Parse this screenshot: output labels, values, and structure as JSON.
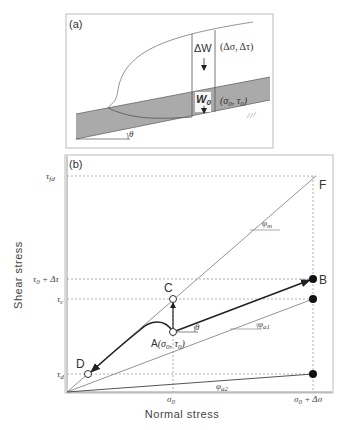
{
  "panel_a": {
    "label": "(a)",
    "delta_w": "ΔW",
    "delta_stress": "(Δσ, Δτ)",
    "w0": "W",
    "w0_sub": "0",
    "initial_stress": "(σ",
    "initial_stress_sub0": "0",
    "initial_stress_mid": ", τ",
    "initial_stress_sub1": "0",
    "initial_stress_end": ")",
    "angle": "θ"
  },
  "panel_b": {
    "label": "(b)",
    "x_axis_label": "Normal stress",
    "y_axis_label": "Shear stress",
    "y_ticks": {
      "tau_fd": "τ",
      "tau_fd_sub": "fd",
      "tau0_plus": "τ",
      "tau0_plus_sub": "0",
      "tau0_plus_rest": " + Δτ",
      "tau_c": "τ",
      "tau_c_sub": "c",
      "tau_d": "τ",
      "tau_d_sub": "d"
    },
    "x_ticks": {
      "sigma0": "σ",
      "sigma0_sub": "0",
      "sigma_end": "σ",
      "sigma_end_sub": "0",
      "sigma_end_rest": " + Δσ"
    },
    "points": {
      "A": "A",
      "A_coords": "(σ",
      "A_coords_sub0": "0",
      "A_coords_mid": ", τ",
      "A_coords_sub1": "0",
      "A_coords_end": ")",
      "B": "B",
      "C": "C",
      "D": "D",
      "F": "F"
    },
    "angles": {
      "phi_m": "φ",
      "phi_m_sub": "m",
      "phi_a1": "φ",
      "phi_a1_sub": "a1",
      "phi_a2": "φ",
      "phi_a2_sub": "a2",
      "theta": "θ"
    }
  },
  "colors": {
    "shaded_layer": "#aaaaaa",
    "line": "#777777",
    "arrow": "#222222",
    "border": "#bbbbbb",
    "dotted": "#888888"
  }
}
